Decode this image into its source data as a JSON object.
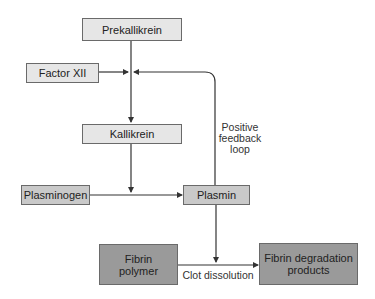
{
  "diagram": {
    "nodes": {
      "prekallikrein": {
        "label": "Prekallikrein"
      },
      "factor_xii": {
        "label": "Factor XII"
      },
      "kallikrein": {
        "label": "Kallikrein"
      },
      "plasminogen": {
        "label": "Plasminogen"
      },
      "plasmin": {
        "label": "Plasmin"
      },
      "fibrin_polymer": {
        "line1": "Fibrin",
        "line2": "polymer"
      },
      "fibrin_degradation": {
        "line1": "Fibrin degradation",
        "line2": "products"
      }
    },
    "annotations": {
      "feedback_line1": "Positive",
      "feedback_line2": "feedback",
      "feedback_line3": "loop",
      "clot_dissolution": "Clot dissolution"
    },
    "colors": {
      "light_box": "#e6e6e6",
      "mid_box": "#c9c9c9",
      "dark_box": "#9a9a9a",
      "line": "#333333"
    }
  }
}
